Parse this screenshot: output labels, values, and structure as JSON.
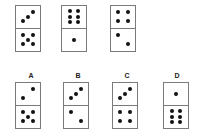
{
  "puzzle": {
    "sequence": [
      {
        "id": "seq-1",
        "top": 3,
        "bottom": 5,
        "x": 15,
        "y": 5
      },
      {
        "id": "seq-2",
        "top": 6,
        "bottom": 1,
        "x": 61,
        "y": 5
      },
      {
        "id": "seq-3",
        "top": 4,
        "bottom": 2,
        "x": 110,
        "y": 5
      }
    ],
    "options": [
      {
        "label": "A",
        "top": 2,
        "bottom": 5,
        "x": 15,
        "y": 82,
        "label_x": 31
      },
      {
        "label": "B",
        "top": 3,
        "bottom": 2,
        "x": 63,
        "y": 82,
        "label_x": 78
      },
      {
        "label": "C",
        "top": 3,
        "bottom": 4,
        "x": 112,
        "y": 82,
        "label_x": 127
      },
      {
        "label": "D",
        "top": 1,
        "bottom": 6,
        "x": 163,
        "y": 82,
        "label_x": 177
      }
    ],
    "label_y": 72
  },
  "colors": {
    "pip": "#111111",
    "border": "#7a7a7a",
    "background": "#ffffff"
  }
}
